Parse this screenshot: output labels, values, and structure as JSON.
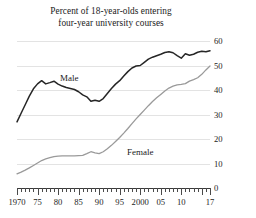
{
  "chart_data": {
    "type": "line",
    "title": "Percent of 18-year-olds entering four-year university courses",
    "title_line1": "Percent of 18-year-olds entering",
    "title_line2": "four-year university courses",
    "xlabel": "",
    "ylabel": "",
    "xlim": [
      1970,
      2017
    ],
    "ylim": [
      0,
      60
    ],
    "yticks": [
      0,
      10,
      20,
      30,
      40,
      50,
      60
    ],
    "ytick_labels": [
      "0",
      "10",
      "20",
      "30",
      "40",
      "50",
      "60"
    ],
    "y_axis_position": "right",
    "grid": true,
    "legend_position": "inline-annotation",
    "xticks_major": [
      1970,
      1975,
      1980,
      1985,
      1990,
      1995,
      2000,
      2005,
      2010,
      2017
    ],
    "xtick_labels": [
      "1970",
      "75",
      "80",
      "85",
      "90",
      "95",
      "2000",
      "05",
      "10",
      "17"
    ],
    "xticks_minor_interval": 1,
    "x": [
      1970,
      1971,
      1972,
      1973,
      1974,
      1975,
      1976,
      1977,
      1978,
      1979,
      1980,
      1981,
      1982,
      1983,
      1984,
      1985,
      1986,
      1987,
      1988,
      1989,
      1990,
      1991,
      1992,
      1993,
      1994,
      1995,
      1996,
      1997,
      1998,
      1999,
      2000,
      2001,
      2002,
      2003,
      2004,
      2005,
      2006,
      2007,
      2008,
      2009,
      2010,
      2011,
      2012,
      2013,
      2014,
      2015,
      2016,
      2017
    ],
    "series": [
      {
        "name": "Male",
        "color": "#262626",
        "label_x": 1980,
        "values": [
          27.0,
          30.5,
          34.0,
          37.5,
          40.5,
          42.5,
          43.8,
          42.5,
          43.0,
          43.6,
          42.4,
          41.6,
          41.0,
          40.6,
          40.2,
          39.3,
          38.0,
          37.2,
          35.4,
          35.8,
          35.4,
          36.5,
          38.6,
          40.6,
          42.4,
          43.8,
          45.7,
          47.5,
          49.0,
          49.8,
          50.0,
          51.3,
          52.6,
          53.4,
          54.0,
          54.6,
          55.3,
          55.6,
          55.2,
          54.0,
          53.0,
          54.8,
          54.2,
          54.6,
          55.4,
          55.8,
          55.6,
          56.0
        ]
      },
      {
        "name": "Female",
        "color": "#9a9a9a",
        "label_x": 2004,
        "values": [
          5.8,
          6.5,
          7.3,
          8.2,
          9.2,
          10.2,
          11.2,
          11.9,
          12.4,
          12.8,
          13.0,
          13.1,
          13.1,
          13.1,
          13.1,
          13.2,
          13.3,
          14.0,
          14.8,
          14.3,
          14.0,
          14.8,
          16.0,
          17.4,
          19.0,
          20.6,
          22.4,
          24.3,
          26.3,
          28.2,
          30.0,
          31.8,
          33.6,
          35.3,
          36.8,
          38.2,
          39.6,
          40.8,
          41.6,
          42.1,
          42.3,
          42.6,
          43.6,
          44.2,
          45.0,
          46.4,
          48.2,
          49.8
        ]
      }
    ]
  }
}
